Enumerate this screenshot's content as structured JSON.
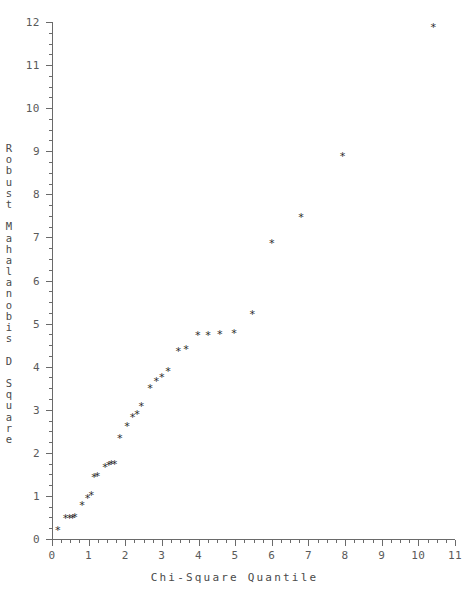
{
  "chart_data": {
    "type": "scatter",
    "title": "",
    "xlabel": "Chi-Square Quantile",
    "ylabel": "Robust Mahalanobis D Square",
    "xlim": [
      0,
      11
    ],
    "ylim": [
      0,
      12
    ],
    "xticks": [
      0,
      1,
      2,
      3,
      4,
      5,
      6,
      7,
      8,
      9,
      10,
      11
    ],
    "xtick_labels": [
      "0",
      "1",
      "2",
      "3",
      "4",
      "5",
      "6",
      "7",
      "8",
      "9",
      "10",
      "11"
    ],
    "yticks": [
      0,
      1,
      2,
      3,
      4,
      5,
      6,
      7,
      8,
      9,
      10,
      11,
      12
    ],
    "ytick_labels": [
      "0",
      "1",
      "2",
      "3",
      "4",
      "5",
      "6",
      "7",
      "8",
      "9",
      "10",
      "11",
      "12"
    ],
    "xtick_minor_step": 0.25,
    "ytick_minor_step": 0.25,
    "grid": false,
    "legend": false,
    "marker": "*",
    "marker_color": "#2b2b2b",
    "axis_color": "#6a6a6a",
    "background_color": "#ffffff",
    "points": [
      {
        "x": 0.16,
        "y": 0.19
      },
      {
        "x": 0.37,
        "y": 0.47
      },
      {
        "x": 0.48,
        "y": 0.48
      },
      {
        "x": 0.56,
        "y": 0.48
      },
      {
        "x": 0.62,
        "y": 0.49
      },
      {
        "x": 0.82,
        "y": 0.77
      },
      {
        "x": 0.97,
        "y": 0.95
      },
      {
        "x": 1.07,
        "y": 1.0
      },
      {
        "x": 1.15,
        "y": 1.43
      },
      {
        "x": 1.24,
        "y": 1.44
      },
      {
        "x": 1.45,
        "y": 1.66
      },
      {
        "x": 1.55,
        "y": 1.7
      },
      {
        "x": 1.62,
        "y": 1.72
      },
      {
        "x": 1.71,
        "y": 1.73
      },
      {
        "x": 1.85,
        "y": 2.33
      },
      {
        "x": 2.05,
        "y": 2.61
      },
      {
        "x": 2.2,
        "y": 2.82
      },
      {
        "x": 2.32,
        "y": 2.9
      },
      {
        "x": 2.44,
        "y": 3.08
      },
      {
        "x": 2.68,
        "y": 3.5
      },
      {
        "x": 2.85,
        "y": 3.65
      },
      {
        "x": 3.0,
        "y": 3.76
      },
      {
        "x": 3.17,
        "y": 3.89
      },
      {
        "x": 3.45,
        "y": 4.36
      },
      {
        "x": 3.66,
        "y": 4.41
      },
      {
        "x": 3.98,
        "y": 4.72
      },
      {
        "x": 4.26,
        "y": 4.73
      },
      {
        "x": 4.58,
        "y": 4.74
      },
      {
        "x": 4.97,
        "y": 4.78
      },
      {
        "x": 5.47,
        "y": 5.2
      },
      {
        "x": 6.0,
        "y": 6.87
      },
      {
        "x": 6.8,
        "y": 7.47
      },
      {
        "x": 7.93,
        "y": 8.87
      },
      {
        "x": 10.41,
        "y": 11.87
      }
    ]
  },
  "labels": {
    "x_axis_title": "Chi-Square Quantile",
    "y_axis_title_chars": [
      "R",
      "o",
      "b",
      "u",
      "s",
      "t",
      " ",
      "M",
      "a",
      "h",
      "a",
      "l",
      "a",
      "n",
      "o",
      "b",
      "i",
      "s",
      " ",
      "D",
      " ",
      "S",
      "q",
      "u",
      "a",
      "r",
      "e"
    ]
  }
}
